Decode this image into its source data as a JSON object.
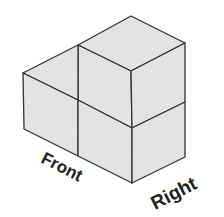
{
  "figure": {
    "type": "isometric-cube-stack",
    "cube_count": 3,
    "labels": {
      "front": "Front",
      "right": "Right"
    },
    "colors": {
      "face_fill": "#e3e3e3",
      "edge_stroke": "#333333",
      "label_color": "#222222",
      "background": "#ffffff"
    }
  }
}
